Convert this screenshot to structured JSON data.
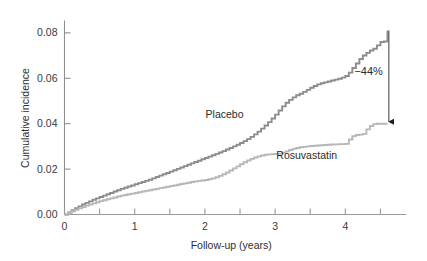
{
  "chart_data": {
    "type": "line",
    "title": "",
    "subtitle": "",
    "xlabel": "Follow-up (years)",
    "ylabel": "Cumulative incidence",
    "xlim": [
      0,
      4.75
    ],
    "ylim": [
      0.0,
      0.085
    ],
    "grid": false,
    "legend_position": "inline-annotations",
    "x_ticks_major": [
      0,
      1,
      2,
      3,
      4
    ],
    "x_ticklabels": [
      "0",
      "1",
      "2",
      "3",
      "4"
    ],
    "x_ticks_minor": [
      0.5,
      1.5,
      2.5,
      3.5,
      4.5
    ],
    "y_ticks": [
      0.0,
      0.02,
      0.04,
      0.06,
      0.08
    ],
    "y_ticklabels": [
      "0.00",
      "0.02",
      "0.04",
      "0.06",
      "0.08"
    ],
    "annotations": [
      {
        "name": "reduction",
        "text": "−44%",
        "x": 4.62,
        "y_from": 0.081,
        "y_to": 0.04
      }
    ],
    "series": [
      {
        "name": "Placebo",
        "color": "#8c8c8c",
        "label_x": 2.28,
        "label_y": 0.0425,
        "final_value": 0.081,
        "x": [
          0,
          0.05,
          0.1,
          0.15,
          0.2,
          0.25,
          0.3,
          0.35,
          0.4,
          0.45,
          0.5,
          0.55,
          0.6,
          0.65,
          0.7,
          0.75,
          0.8,
          0.85,
          0.9,
          0.95,
          1.0,
          1.05,
          1.1,
          1.15,
          1.2,
          1.25,
          1.3,
          1.35,
          1.4,
          1.45,
          1.5,
          1.55,
          1.6,
          1.65,
          1.7,
          1.75,
          1.8,
          1.85,
          1.9,
          1.95,
          2.0,
          2.05,
          2.1,
          2.15,
          2.2,
          2.25,
          2.3,
          2.35,
          2.4,
          2.45,
          2.5,
          2.55,
          2.6,
          2.65,
          2.7,
          2.75,
          2.8,
          2.85,
          2.9,
          2.95,
          3.0,
          3.05,
          3.1,
          3.15,
          3.2,
          3.25,
          3.3,
          3.35,
          3.4,
          3.45,
          3.5,
          3.55,
          3.6,
          3.65,
          3.7,
          3.75,
          3.8,
          3.85,
          3.9,
          3.95,
          4.0,
          4.05,
          4.1,
          4.15,
          4.2,
          4.25,
          4.3,
          4.35,
          4.4,
          4.45,
          4.5,
          4.55,
          4.6
        ],
        "y": [
          0.0,
          0.0009,
          0.0019,
          0.0028,
          0.0036,
          0.0044,
          0.0051,
          0.0058,
          0.0065,
          0.0071,
          0.0077,
          0.0083,
          0.0089,
          0.0095,
          0.0101,
          0.0107,
          0.0113,
          0.0118,
          0.0123,
          0.0128,
          0.0133,
          0.0138,
          0.0143,
          0.0148,
          0.0153,
          0.0159,
          0.0165,
          0.0171,
          0.0177,
          0.0183,
          0.0189,
          0.0195,
          0.0201,
          0.0207,
          0.0213,
          0.0219,
          0.0225,
          0.0231,
          0.0237,
          0.0243,
          0.0249,
          0.0255,
          0.0261,
          0.0267,
          0.0273,
          0.0279,
          0.0286,
          0.0293,
          0.03,
          0.0307,
          0.0315,
          0.0323,
          0.0332,
          0.0342,
          0.0353,
          0.0365,
          0.0378,
          0.0392,
          0.0407,
          0.0423,
          0.044,
          0.0458,
          0.0476,
          0.0492,
          0.0505,
          0.0516,
          0.0525,
          0.0532,
          0.054,
          0.0549,
          0.0558,
          0.0566,
          0.0573,
          0.0578,
          0.0582,
          0.0586,
          0.059,
          0.0594,
          0.0598,
          0.0603,
          0.061,
          0.0625,
          0.0645,
          0.0665,
          0.0685,
          0.07,
          0.0712,
          0.0722,
          0.073,
          0.0745,
          0.076,
          0.0762,
          0.081
        ]
      },
      {
        "name": "Rosuvastatin",
        "color": "#b7b7b7",
        "label_x": 3.45,
        "label_y": 0.0245,
        "final_value": 0.04,
        "x": [
          0,
          0.05,
          0.1,
          0.15,
          0.2,
          0.25,
          0.3,
          0.35,
          0.4,
          0.45,
          0.5,
          0.55,
          0.6,
          0.65,
          0.7,
          0.75,
          0.8,
          0.85,
          0.9,
          0.95,
          1.0,
          1.05,
          1.1,
          1.15,
          1.2,
          1.25,
          1.3,
          1.35,
          1.4,
          1.45,
          1.5,
          1.55,
          1.6,
          1.65,
          1.7,
          1.75,
          1.8,
          1.85,
          1.9,
          1.95,
          2.0,
          2.05,
          2.1,
          2.15,
          2.2,
          2.25,
          2.3,
          2.35,
          2.4,
          2.45,
          2.5,
          2.55,
          2.6,
          2.65,
          2.7,
          2.75,
          2.8,
          2.85,
          2.9,
          2.95,
          3.0,
          3.05,
          3.1,
          3.15,
          3.2,
          3.25,
          3.3,
          3.35,
          3.4,
          3.45,
          3.5,
          3.55,
          3.6,
          3.65,
          3.7,
          3.75,
          3.8,
          3.85,
          3.9,
          3.95,
          4.0,
          4.05,
          4.1,
          4.15,
          4.2,
          4.25,
          4.3,
          4.35,
          4.4,
          4.45,
          4.5,
          4.55,
          4.6
        ],
        "y": [
          0.0,
          0.0007,
          0.0014,
          0.0021,
          0.0027,
          0.0033,
          0.0039,
          0.0044,
          0.0049,
          0.0054,
          0.0059,
          0.0063,
          0.0067,
          0.0071,
          0.0075,
          0.0079,
          0.0083,
          0.0086,
          0.0089,
          0.0092,
          0.0095,
          0.0098,
          0.0101,
          0.0104,
          0.0107,
          0.011,
          0.0113,
          0.0116,
          0.0119,
          0.0122,
          0.0125,
          0.0128,
          0.0131,
          0.0134,
          0.0137,
          0.014,
          0.0143,
          0.0146,
          0.0148,
          0.015,
          0.0152,
          0.0155,
          0.0159,
          0.0164,
          0.017,
          0.0177,
          0.0185,
          0.0194,
          0.0203,
          0.0212,
          0.0221,
          0.023,
          0.0238,
          0.0245,
          0.0251,
          0.0256,
          0.026,
          0.0263,
          0.0265,
          0.0266,
          0.0267,
          0.0268,
          0.0272,
          0.0278,
          0.0284,
          0.0289,
          0.0293,
          0.0296,
          0.0298,
          0.03,
          0.0302,
          0.0303,
          0.0304,
          0.0305,
          0.0306,
          0.0307,
          0.0308,
          0.0309,
          0.031,
          0.031,
          0.0311,
          0.033,
          0.0345,
          0.035,
          0.0352,
          0.0355,
          0.0375,
          0.039,
          0.0398,
          0.04,
          0.04,
          0.04,
          0.04
        ]
      }
    ]
  },
  "axes": {
    "y_title": "Cumulative incidence",
    "x_title": "Follow-up (years)"
  }
}
